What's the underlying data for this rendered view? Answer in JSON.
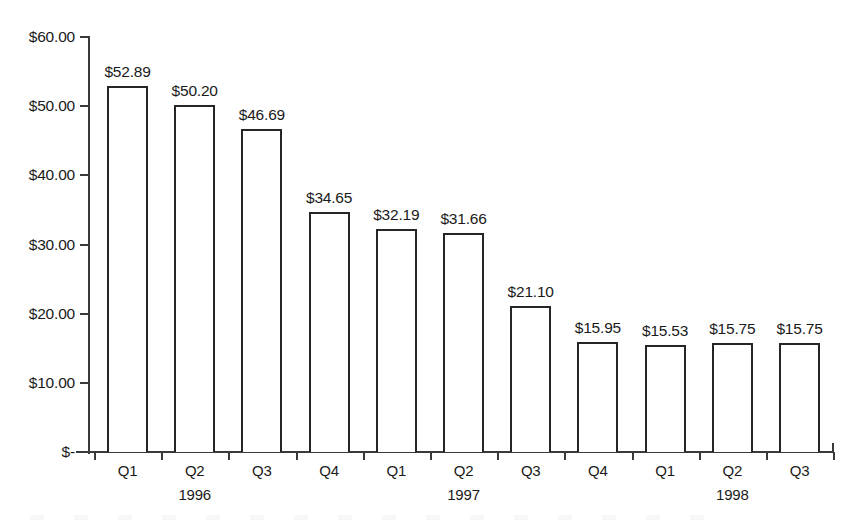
{
  "chart_data": {
    "type": "bar",
    "title": "",
    "subtitle": "",
    "xlabel": "",
    "ylabel": "",
    "categories": [
      "Q1",
      "Q2",
      "Q3",
      "Q4",
      "Q1",
      "Q2",
      "Q3",
      "Q4",
      "Q1",
      "Q2",
      "Q3"
    ],
    "group_labels": [
      {
        "index": 1,
        "label": "1996"
      },
      {
        "index": 5,
        "label": "1997"
      },
      {
        "index": 9,
        "label": "1998"
      }
    ],
    "values": [
      52.89,
      50.2,
      46.69,
      34.65,
      32.19,
      31.66,
      21.1,
      15.95,
      15.53,
      15.75,
      15.75
    ],
    "value_labels": [
      "$52.89",
      "$50.20",
      "$46.69",
      "$34.65",
      "$32.19",
      "$31.66",
      "$21.10",
      "$15.95",
      "$15.53",
      "$15.75",
      "$15.75"
    ],
    "ylim": [
      0,
      60
    ],
    "ytick_values": [
      0,
      10,
      20,
      30,
      40,
      50,
      60
    ],
    "ytick_labels": [
      "$-",
      "$10.00",
      "$20.00",
      "$30.00",
      "$40.00",
      "$50.00",
      "$60.00"
    ],
    "grid": false,
    "legend": false,
    "legend_position": "none",
    "bar_fill": "#ffffff",
    "bar_border": "#262626",
    "axis_color": "#3a3a3a",
    "background": "#ffffff"
  }
}
